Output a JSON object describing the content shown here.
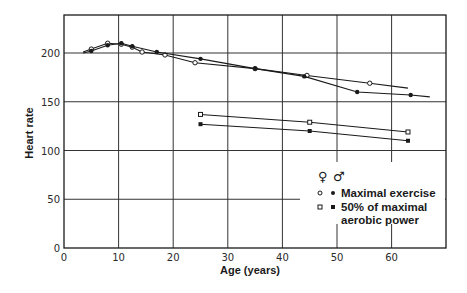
{
  "chart_data": {
    "type": "line",
    "title": "",
    "xlabel": "Age (years)",
    "ylabel": "Heart rate",
    "xlim": [
      0,
      70
    ],
    "ylim": [
      0,
      240
    ],
    "x_ticks": [
      0,
      10,
      20,
      30,
      40,
      50,
      60
    ],
    "y_ticks": [
      0,
      50,
      100,
      150,
      200
    ],
    "x_tick_labels": [
      "0",
      "10",
      "20",
      "30",
      "40",
      "50",
      "60"
    ],
    "y_tick_labels": [
      "0",
      "50",
      "100",
      "150",
      "200"
    ],
    "grid": true,
    "legend_position": "lower right (inside plot)",
    "legend": {
      "header_female": "♀",
      "header_male": "♂",
      "entries": [
        {
          "label": "Maximal exercise",
          "female_marker": "open circle",
          "male_marker": "filled circle"
        },
        {
          "label_line1": "50% of maximal",
          "label_line2": "aerobic power",
          "female_marker": "open square",
          "male_marker": "filled square"
        }
      ]
    },
    "series": [
      {
        "name": "Maximal exercise (female)",
        "marker": "open-circle",
        "x": [
          3.5,
          5,
          8,
          10.5,
          12.5,
          14.3,
          18.5,
          24,
          35,
          44.5,
          56,
          63
        ],
        "y": [
          201,
          204,
          210,
          209,
          206,
          201,
          198,
          190,
          184,
          177,
          169,
          164
        ],
        "marker_points": [
          1,
          2,
          3,
          4,
          5,
          6,
          7,
          8,
          9,
          10
        ]
      },
      {
        "name": "Maximal exercise (male)",
        "marker": "filled-circle",
        "x": [
          3.5,
          5,
          8,
          10.5,
          12.5,
          17,
          25,
          35,
          44,
          53.7,
          63.5,
          67
        ],
        "y": [
          200,
          202,
          208,
          210,
          207,
          201,
          194,
          184,
          176,
          160,
          157,
          155
        ],
        "marker_points": [
          1,
          2,
          3,
          4,
          5,
          6,
          7,
          8,
          9,
          10
        ]
      },
      {
        "name": "50% of maximal aerobic power (female)",
        "marker": "open-square",
        "x": [
          25,
          45,
          63
        ],
        "y": [
          137,
          129,
          119
        ]
      },
      {
        "name": "50% of maximal aerobic power (male)",
        "marker": "filled-square",
        "x": [
          25,
          45,
          63
        ],
        "y": [
          127,
          120,
          110
        ]
      }
    ]
  },
  "colors": {
    "line": "#1a1a1a",
    "grid": "#333333",
    "background": "#ffffff"
  }
}
